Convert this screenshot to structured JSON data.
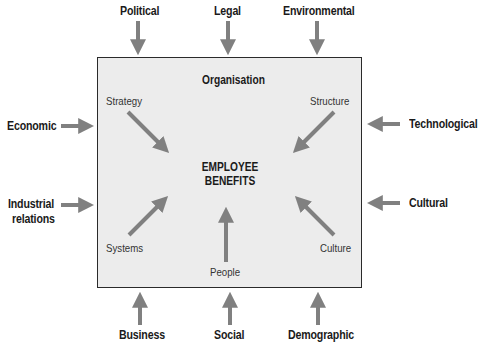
{
  "diagram": {
    "box_title": "Organisation",
    "center_label_line1": "EMPLOYEE",
    "center_label_line2": "BENEFITS",
    "external_factors": {
      "top": [
        "Political",
        "Legal",
        "Environmental"
      ],
      "left": [
        "Economic",
        "Industrial",
        "relations"
      ],
      "right": [
        "Technological",
        "Cultural"
      ],
      "bottom": [
        "Business",
        "Social",
        "Demographic"
      ]
    },
    "internal_factors": {
      "top_left": "Strategy",
      "top_right": "Structure",
      "bottom_left": "Systems",
      "bottom_center": "People",
      "bottom_right": "Culture"
    },
    "colors": {
      "box_fill": "#ececec",
      "box_border": "#2a2a2a",
      "arrow": "#808080"
    }
  }
}
